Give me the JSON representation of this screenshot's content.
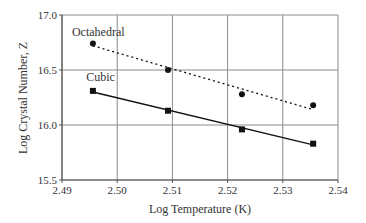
{
  "chart_data": {
    "type": "line",
    "title": "",
    "xlabel": "Log Temperature (K)",
    "ylabel": "Log Crystal Number, Z",
    "xlim": [
      2.49,
      2.54
    ],
    "ylim": [
      15.5,
      17.0
    ],
    "x_ticks": [
      "2.49",
      "2.50",
      "2.51",
      "2.52",
      "2.53",
      "2.54"
    ],
    "y_ticks": [
      "15.5",
      "16.0",
      "16.5",
      "17.0"
    ],
    "x_tick_values": [
      2.49,
      2.5,
      2.51,
      2.52,
      2.53,
      2.54
    ],
    "y_tick_values": [
      15.5,
      16.0,
      16.5,
      17.0
    ],
    "grid": true,
    "legend": "inline labels",
    "series": [
      {
        "name": "Octahedral",
        "marker": "circle",
        "line_style": "dotted",
        "x": [
          2.4956,
          2.5092,
          2.5226,
          2.5355
        ],
        "y": [
          16.74,
          16.5,
          16.28,
          16.18
        ],
        "fit": {
          "x": [
            2.4956,
            2.5355
          ],
          "y": [
            16.72,
            16.14
          ]
        }
      },
      {
        "name": "Cubic",
        "marker": "square",
        "line_style": "solid",
        "x": [
          2.4956,
          2.5092,
          2.5226,
          2.5355
        ],
        "y": [
          16.31,
          16.13,
          15.96,
          15.83
        ],
        "fit": {
          "x": [
            2.4956,
            2.5355
          ],
          "y": [
            16.3,
            15.82
          ]
        }
      }
    ],
    "annotations": [
      {
        "text": "Octahedral",
        "x": 2.4918,
        "y": 16.81
      },
      {
        "text": "Cubic",
        "x": 2.4944,
        "y": 16.4
      }
    ]
  },
  "colors": {
    "axis": "#555555",
    "grid": "#8a8a8a",
    "series": "#111111",
    "text": "#333333"
  }
}
